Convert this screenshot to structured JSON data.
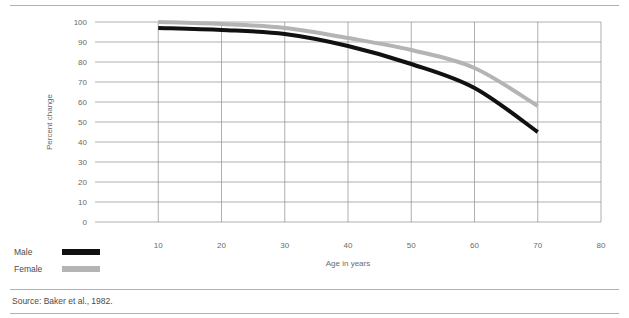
{
  "figure": {
    "source_note": "Source: Baker et al., 1982."
  },
  "legend": {
    "position": "bottom-left",
    "items": [
      {
        "label": "Male",
        "color": "#111111"
      },
      {
        "label": "Female",
        "color": "#b4b4b4"
      }
    ]
  },
  "chart_data": {
    "type": "line",
    "title": "",
    "subtitle": "",
    "xlabel": "Age in years",
    "ylabel": "Percent change",
    "xlim": [
      0,
      80
    ],
    "ylim": [
      0,
      100
    ],
    "xticks": [
      10,
      20,
      30,
      40,
      50,
      60,
      70,
      80
    ],
    "yticks": [
      0,
      10,
      20,
      30,
      40,
      50,
      60,
      70,
      80,
      90,
      100
    ],
    "xtick_labels": [
      "10",
      "20",
      "30",
      "40",
      "50",
      "60",
      "70",
      "80"
    ],
    "ytick_labels": [
      "0",
      "10",
      "20",
      "30",
      "40",
      "50",
      "60",
      "70",
      "80",
      "90",
      "100"
    ],
    "grid": {
      "horizontal": true,
      "vertical": true,
      "color": "#8c8c8c"
    },
    "legend_position": "outside-bottom-left",
    "x": [
      10,
      20,
      30,
      40,
      50,
      60,
      70
    ],
    "series": [
      {
        "name": "Male",
        "color": "#111111",
        "values": [
          97,
          96,
          94,
          88,
          79,
          67,
          45
        ]
      },
      {
        "name": "Female",
        "color": "#b4b4b4",
        "values": [
          100,
          99,
          97,
          92,
          86,
          77,
          58
        ]
      }
    ],
    "annotations": []
  }
}
